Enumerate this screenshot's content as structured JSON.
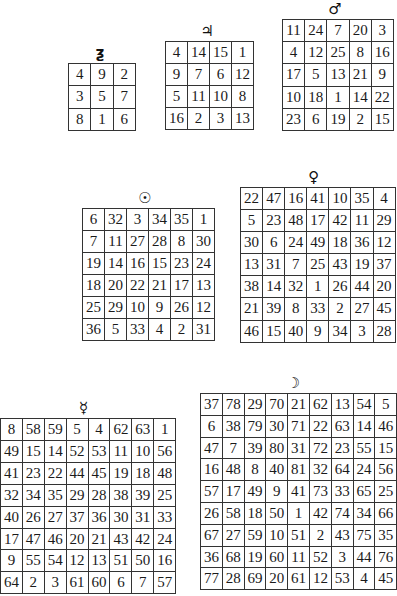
{
  "squares": [
    {
      "id": "saturn",
      "planet": "Saturn",
      "symbol": "♄",
      "display_symbol": "ƺ",
      "order": 3,
      "rows": [
        [
          4,
          9,
          2
        ],
        [
          3,
          5,
          7
        ],
        [
          8,
          1,
          6
        ]
      ]
    },
    {
      "id": "jupiter",
      "planet": "Jupiter",
      "symbol": "♃",
      "display_symbol": "♃",
      "order": 4,
      "rows": [
        [
          4,
          14,
          15,
          1
        ],
        [
          9,
          7,
          6,
          12
        ],
        [
          5,
          11,
          10,
          8
        ],
        [
          16,
          2,
          3,
          13
        ]
      ]
    },
    {
      "id": "mars",
      "planet": "Mars",
      "symbol": "♂",
      "display_symbol": "♂",
      "order": 5,
      "rows": [
        [
          11,
          24,
          7,
          20,
          3
        ],
        [
          4,
          12,
          25,
          8,
          16
        ],
        [
          17,
          5,
          13,
          21,
          9
        ],
        [
          10,
          18,
          1,
          14,
          22
        ],
        [
          23,
          6,
          19,
          2,
          15
        ]
      ]
    },
    {
      "id": "sun",
      "planet": "Sun",
      "symbol": "☉",
      "display_symbol": "☉",
      "order": 6,
      "rows": [
        [
          6,
          32,
          3,
          34,
          35,
          1
        ],
        [
          7,
          11,
          27,
          28,
          8,
          30
        ],
        [
          19,
          14,
          16,
          15,
          23,
          24
        ],
        [
          18,
          20,
          22,
          21,
          17,
          13
        ],
        [
          25,
          29,
          10,
          9,
          26,
          12
        ],
        [
          36,
          5,
          33,
          4,
          2,
          31
        ]
      ]
    },
    {
      "id": "venus",
      "planet": "Venus",
      "symbol": "♀",
      "display_symbol": "♀",
      "order": 7,
      "rows": [
        [
          22,
          47,
          16,
          41,
          10,
          35,
          4
        ],
        [
          5,
          23,
          48,
          17,
          42,
          11,
          29
        ],
        [
          30,
          6,
          24,
          49,
          18,
          36,
          12
        ],
        [
          13,
          31,
          7,
          25,
          43,
          19,
          37
        ],
        [
          38,
          14,
          32,
          1,
          26,
          44,
          20
        ],
        [
          21,
          39,
          8,
          33,
          2,
          27,
          45
        ],
        [
          46,
          15,
          40,
          9,
          34,
          3,
          28
        ]
      ]
    },
    {
      "id": "mercury",
      "planet": "Mercury",
      "symbol": "☿",
      "display_symbol": "☿",
      "order": 8,
      "rows": [
        [
          8,
          58,
          59,
          5,
          4,
          62,
          63,
          1
        ],
        [
          49,
          15,
          14,
          52,
          53,
          11,
          10,
          56
        ],
        [
          41,
          23,
          22,
          44,
          45,
          19,
          18,
          48
        ],
        [
          32,
          34,
          35,
          29,
          28,
          38,
          39,
          25
        ],
        [
          40,
          26,
          27,
          37,
          36,
          30,
          31,
          33
        ],
        [
          17,
          47,
          46,
          20,
          21,
          43,
          42,
          24
        ],
        [
          9,
          55,
          54,
          12,
          13,
          51,
          50,
          16
        ],
        [
          64,
          2,
          3,
          61,
          60,
          6,
          7,
          57
        ]
      ]
    },
    {
      "id": "moon",
      "planet": "Moon",
      "symbol": "☽",
      "display_symbol": "☽",
      "order": 9,
      "rows": [
        [
          37,
          78,
          29,
          70,
          21,
          62,
          13,
          54,
          5
        ],
        [
          6,
          38,
          79,
          30,
          71,
          22,
          63,
          14,
          46
        ],
        [
          47,
          7,
          39,
          80,
          31,
          72,
          23,
          55,
          15
        ],
        [
          16,
          48,
          8,
          40,
          81,
          32,
          64,
          24,
          56
        ],
        [
          57,
          17,
          49,
          9,
          41,
          73,
          33,
          65,
          25
        ],
        [
          26,
          58,
          18,
          50,
          1,
          42,
          74,
          34,
          66
        ],
        [
          67,
          27,
          59,
          10,
          51,
          2,
          43,
          75,
          35
        ],
        [
          36,
          68,
          19,
          60,
          11,
          52,
          3,
          44,
          76
        ],
        [
          77,
          28,
          69,
          20,
          61,
          12,
          53,
          4,
          45
        ]
      ]
    }
  ],
  "layout": {
    "saturn": {
      "left": 68,
      "top": 63,
      "cell": 21.3
    },
    "jupiter": {
      "left": 165,
      "top": 41,
      "cell": 21.0
    },
    "mars": {
      "left": 282,
      "top": 19,
      "cell": 21.2
    },
    "sun": {
      "left": 82,
      "top": 208,
      "cell": 21.0
    },
    "venus": {
      "left": 240,
      "top": 187,
      "cell": 21.1
    },
    "mercury": {
      "left": 0,
      "top": 418,
      "cell": 20.9
    },
    "moon": {
      "left": 200,
      "top": 393,
      "cell": 20.8
    }
  }
}
